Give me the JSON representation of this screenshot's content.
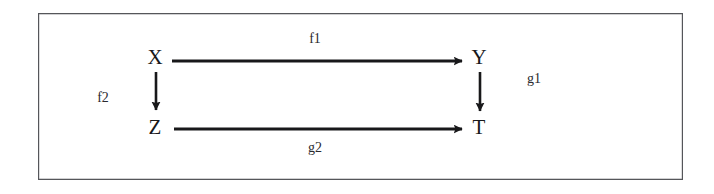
{
  "figure": {
    "kind": "commutative-square-diagram",
    "background_color": "#ffffff",
    "frame_color": "#55565a",
    "ink_color": "#18181a"
  },
  "nodes": [
    {
      "id": "x",
      "label": "X",
      "x": 155,
      "y": 57
    },
    {
      "id": "y",
      "label": "Y",
      "x": 479,
      "y": 57
    },
    {
      "id": "z",
      "label": "Z",
      "x": 155,
      "y": 127
    },
    {
      "id": "t",
      "label": "T",
      "x": 479,
      "y": 127
    }
  ],
  "edges": [
    {
      "id": "f1",
      "label": "f1",
      "from": "x",
      "to": "y",
      "orientation": "horizontal",
      "label_x": 315,
      "label_y": 39
    },
    {
      "id": "g2",
      "label": "g2",
      "from": "z",
      "to": "t",
      "orientation": "horizontal",
      "label_x": 315,
      "label_y": 148
    },
    {
      "id": "f2",
      "label": "f2",
      "from": "x",
      "to": "z",
      "orientation": "vertical",
      "label_x": 103,
      "label_y": 98
    },
    {
      "id": "g1",
      "label": "g1",
      "from": "y",
      "to": "t",
      "orientation": "vertical",
      "label_x": 534,
      "label_y": 79
    }
  ]
}
